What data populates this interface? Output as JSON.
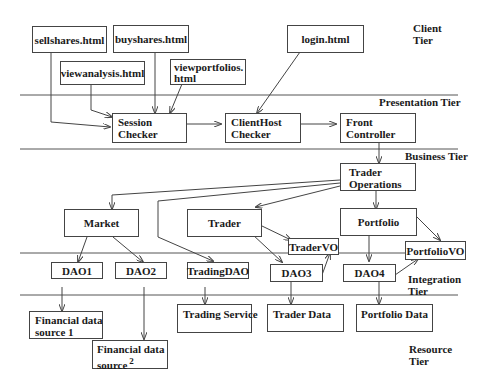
{
  "tiers": {
    "client": [
      "Client",
      "Tier"
    ],
    "presentation": "Presentation Tier",
    "business": "Business Tier",
    "integration": [
      "Integration",
      "Tier"
    ],
    "resource": [
      "Resource",
      "Tier"
    ]
  },
  "client_nodes": {
    "sellshares": "sellshares.html",
    "buyshares": "buyshares.html",
    "viewanalysis": "viewanalysis.html",
    "viewportfolios": [
      "viewportfolios.",
      "html"
    ],
    "login": "login.html"
  },
  "presentation_nodes": {
    "session_checker": [
      "Session",
      "Checker"
    ],
    "clienthost_checker": [
      "ClientHost",
      "Checker"
    ],
    "front_controller": [
      "Front",
      "Controller"
    ]
  },
  "business_nodes": {
    "trader_operations": [
      "Trader",
      "Operations"
    ],
    "market": "Market",
    "trader": "Trader",
    "portfolio": "Portfolio",
    "trader_vo": "TraderVO",
    "portfolio_vo": "PortfolioVO"
  },
  "integration_nodes": {
    "dao1": "DAO1",
    "dao2": "DAO2",
    "trading_dao": "TradingDAO",
    "dao3": "DAO3",
    "dao4": "DAO4"
  },
  "resource_nodes": {
    "fds1": [
      "Financial data",
      "source 1"
    ],
    "fds2": [
      "Financial data",
      "source"
    ],
    "fds2_sup": "2",
    "trading_service": "Trading Service",
    "trader_data": "Trader Data",
    "portfolio_data": "Portfolio Data"
  }
}
